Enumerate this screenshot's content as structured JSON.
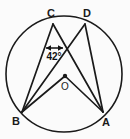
{
  "figure": {
    "background_color": "#fbfbfb",
    "stroke_color": "#1a1a1a",
    "circle": {
      "center_x": 64,
      "center_y": 74,
      "radius": 58,
      "stroke_width": 1.6
    },
    "points": {
      "C": {
        "label": "C",
        "x": 53,
        "y": 24,
        "label_x": 51,
        "label_y": 17
      },
      "D": {
        "label": "D",
        "x": 85,
        "y": 24,
        "label_x": 86,
        "label_y": 17
      },
      "B": {
        "label": "B",
        "x": 22,
        "y": 112,
        "label_x": 16,
        "label_y": 124
      },
      "A": {
        "label": "A",
        "x": 103,
        "y": 112,
        "label_x": 104,
        "label_y": 125
      },
      "O": {
        "label": "O",
        "x": 65,
        "y": 76,
        "label_x": 65,
        "label_y": 90
      }
    },
    "chords": [
      {
        "name": "chord-C-to-B",
        "from": "C",
        "to": "B"
      },
      {
        "name": "chord-C-to-A",
        "from": "C",
        "to": "A"
      },
      {
        "name": "chord-D-to-B",
        "from": "D",
        "to": "B"
      },
      {
        "name": "chord-D-to-A",
        "from": "D",
        "to": "A"
      },
      {
        "name": "radius-O-to-B",
        "from": "O",
        "to": "B"
      },
      {
        "name": "radius-O-to-A",
        "from": "O",
        "to": "A"
      }
    ],
    "angle_annotation": {
      "value_text": "42°",
      "text_x": 54,
      "text_y": 60,
      "arrow_y": 48,
      "arrow_x_start": 46,
      "arrow_x_end": 63
    },
    "center_dot": {
      "x": 65,
      "y": 76,
      "radius": 2.2
    }
  }
}
